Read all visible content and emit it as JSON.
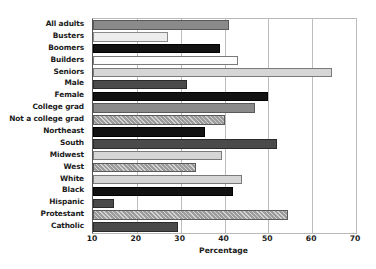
{
  "chart_data": {
    "type": "bar",
    "orientation": "horizontal",
    "title": "",
    "xlabel": "Percentage",
    "ylabel": "",
    "xlim": [
      10,
      70
    ],
    "xticks": [
      10,
      20,
      30,
      40,
      50,
      60,
      70
    ],
    "grid": "vertical",
    "legend": "none",
    "categories": [
      "All adults",
      "Busters",
      "Boomers",
      "Builders",
      "Seniors",
      "Male",
      "Female",
      "College grad",
      "Not a college grad",
      "Northeast",
      "South",
      "Midwest",
      "West",
      "White",
      "Black",
      "Hispanic",
      "Protestant",
      "Catholic"
    ],
    "values": [
      41,
      27,
      39,
      43,
      64.5,
      31.5,
      50,
      47,
      40,
      35.5,
      52,
      39.5,
      33.5,
      44,
      42,
      14.7,
      54.5,
      29.5
    ],
    "bar_styles": [
      "sw-mid",
      "sw-vlight",
      "sw-dark",
      "sw-white",
      "sw-light",
      "sw-mdark",
      "sw-dark",
      "sw-mid",
      "sw-hatch",
      "sw-dark",
      "sw-mdark",
      "sw-light",
      "sw-hatch",
      "sw-light",
      "sw-dark",
      "sw-mdark",
      "sw-hatch",
      "sw-mdark"
    ]
  },
  "colors": {
    "frame": "#b9b9b9",
    "grid": "#bdbdbd",
    "text": "#1a1a1a",
    "background": "#ffffff"
  }
}
